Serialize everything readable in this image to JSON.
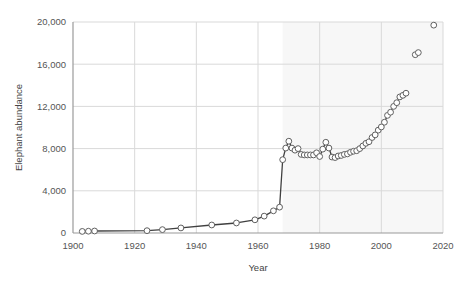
{
  "chart_data": {
    "type": "line",
    "title": "",
    "xlabel": "Year",
    "ylabel": "Elephant abundance",
    "xlim": [
      1900,
      2020
    ],
    "ylim": [
      0,
      20000
    ],
    "xticks": [
      1900,
      1920,
      1940,
      1960,
      1980,
      2000,
      2020
    ],
    "xtick_labels": [
      "1900",
      "1920",
      "1940",
      "1960",
      "1980",
      "2000",
      "2020"
    ],
    "yticks": [
      0,
      4000,
      8000,
      12000,
      16000,
      20000
    ],
    "ytick_labels": [
      "0",
      "4,000",
      "8,000",
      "12,000",
      "16,000",
      "20,000"
    ],
    "grid": "both",
    "legend_position": "none",
    "marker": "open-circle",
    "line_color": "#404040",
    "marker_edge_color": "#606060",
    "marker_face_color": "#ffffff",
    "shaded_region": {
      "x_start": 1968,
      "x_end": 2020,
      "y_start": 0,
      "y_end": 20000,
      "color": "#f7f7f7"
    },
    "series": [
      {
        "name": "Elephant abundance (connected survey series)",
        "connected": true,
        "x": [
          1903,
          1905,
          1907,
          1924,
          1929,
          1935,
          1945,
          1953,
          1959,
          1962,
          1965,
          1967,
          1968,
          1969,
          1970,
          1971,
          1972,
          1973,
          1974,
          1975,
          1976,
          1977,
          1978,
          1979,
          1980,
          1981,
          1982,
          1983,
          1984,
          1985,
          1986,
          1987,
          1988,
          1989,
          1990,
          1991,
          1992,
          1993,
          1994,
          1995,
          1996,
          1997,
          1998,
          1999,
          2000,
          2001,
          2002,
          2003,
          2004,
          2005,
          2006,
          2007,
          2008
        ],
        "values": [
          150,
          170,
          190,
          220,
          320,
          480,
          760,
          950,
          1250,
          1600,
          2100,
          2450,
          6950,
          8050,
          8700,
          8050,
          7850,
          8000,
          7450,
          7400,
          7400,
          7400,
          7400,
          7600,
          7250,
          7950,
          8600,
          8050,
          7200,
          7150,
          7300,
          7350,
          7450,
          7500,
          7650,
          7750,
          7800,
          8000,
          8250,
          8500,
          8650,
          9050,
          9300,
          9750,
          10050,
          10500,
          11150,
          11450,
          12000,
          12350,
          12900,
          13050,
          13250
        ]
      },
      {
        "name": "Elephant abundance (recent isolated estimates)",
        "connected": false,
        "x": [
          2011,
          2012,
          2017
        ],
        "values": [
          16900,
          17100,
          19700
        ]
      }
    ]
  }
}
